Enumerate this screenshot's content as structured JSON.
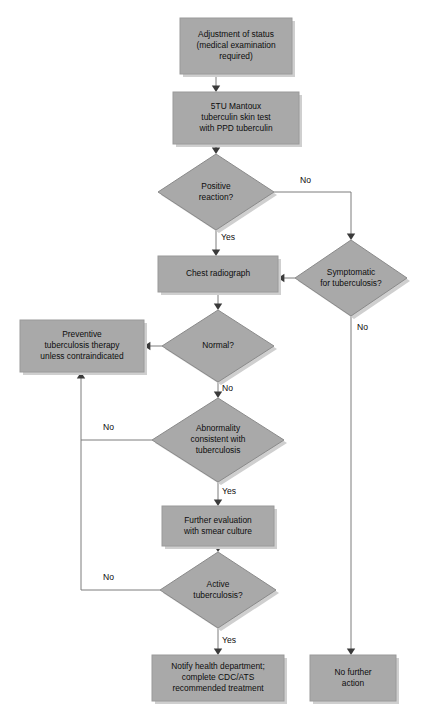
{
  "chart_data": {
    "type": "diagram",
    "subtype": "flowchart",
    "colors": {
      "node_fill": "#a9a9a9",
      "node_stroke": "#8a8a8a",
      "shadow": "#cfcfcf",
      "line": "#7c7c7c",
      "arrow": "#3a3a3a",
      "text": "#0d0d0d",
      "background": "#ffffff"
    },
    "nodes": [
      {
        "id": "adjustment",
        "shape": "box",
        "lines": [
          "Adjustment of status",
          "(medical examination",
          "required)"
        ],
        "x": 180,
        "y": 18,
        "w": 112,
        "h": 56
      },
      {
        "id": "mantoux",
        "shape": "box",
        "lines": [
          "5TU Mantoux",
          "tuberculin skin test",
          "with PPD tuberculin"
        ],
        "x": 173,
        "y": 92,
        "w": 126,
        "h": 52
      },
      {
        "id": "positive_reaction",
        "shape": "diamond",
        "lines": [
          "Positive",
          "reaction?"
        ],
        "cx": 216,
        "cy": 192,
        "rx": 58,
        "ry": 38
      },
      {
        "id": "symptomatic",
        "shape": "diamond",
        "lines": [
          "Symptomatic",
          "for tuberculosis?"
        ],
        "cx": 351,
        "cy": 278,
        "rx": 56,
        "ry": 38
      },
      {
        "id": "chest_radiograph",
        "shape": "box",
        "lines": [
          "Chest radiograph"
        ],
        "x": 158,
        "y": 256,
        "w": 120,
        "h": 36
      },
      {
        "id": "normal",
        "shape": "diamond",
        "lines": [
          "Normal?"
        ],
        "cx": 218,
        "cy": 346,
        "rx": 56,
        "ry": 36
      },
      {
        "id": "preventive",
        "shape": "box",
        "lines": [
          "Preventive",
          "tuberculosis therapy",
          "unless contraindicated"
        ],
        "x": 20,
        "y": 320,
        "w": 124,
        "h": 52
      },
      {
        "id": "abnormality",
        "shape": "diamond",
        "lines": [
          "Abnormality",
          "consistent with",
          "tuberculosis"
        ],
        "cx": 218,
        "cy": 440,
        "rx": 66,
        "ry": 42
      },
      {
        "id": "further_evaluation",
        "shape": "box",
        "lines": [
          "Further evaluation",
          "with smear culture"
        ],
        "x": 162,
        "y": 506,
        "w": 112,
        "h": 40
      },
      {
        "id": "active_tb",
        "shape": "diamond",
        "lines": [
          "Active",
          "tuberculosis?"
        ],
        "cx": 218,
        "cy": 590,
        "rx": 58,
        "ry": 38
      },
      {
        "id": "notify",
        "shape": "box",
        "lines": [
          "Notify health department;",
          "complete CDC/ATS",
          "recommended treatment"
        ],
        "x": 152,
        "y": 655,
        "w": 132,
        "h": 46
      },
      {
        "id": "no_action",
        "shape": "box",
        "lines": [
          "No further",
          "action"
        ],
        "x": 310,
        "y": 655,
        "w": 86,
        "h": 46
      }
    ],
    "edges": [
      {
        "id": "e1",
        "from": "adjustment",
        "to": "mantoux",
        "label": "",
        "path": "M216,74 L216,88",
        "arrow": {
          "x": 216,
          "y": 92,
          "dir": "down"
        }
      },
      {
        "id": "e2",
        "from": "mantoux",
        "to": "positive_reaction",
        "label": "",
        "path": "M216,144 L216,150",
        "arrow": {
          "x": 216,
          "y": 154,
          "dir": "down"
        }
      },
      {
        "id": "e3",
        "from": "positive_reaction",
        "to": "chest_radiograph",
        "label": "Yes",
        "label_x": 221,
        "label_y": 238,
        "path": "M216,230 L216,250",
        "arrow": {
          "x": 216,
          "y": 256,
          "dir": "down"
        }
      },
      {
        "id": "e4",
        "from": "positive_reaction",
        "to": "symptomatic",
        "label": "No",
        "label_x": 300,
        "label_y": 181,
        "path": "M274,192 L351,192 L351,234",
        "arrow": {
          "x": 351,
          "y": 240,
          "dir": "down"
        }
      },
      {
        "id": "e5",
        "from": "symptomatic",
        "to": "chest_radiograph",
        "label": "",
        "path": "M295,278 L284,278",
        "arrow": {
          "x": 278,
          "y": 278,
          "dir": "left"
        }
      },
      {
        "id": "e6",
        "from": "symptomatic",
        "to": "no_action",
        "label": "No",
        "label_x": 357,
        "label_y": 328,
        "path": "M351,316 L351,649",
        "arrow": {
          "x": 351,
          "y": 655,
          "dir": "down"
        }
      },
      {
        "id": "e7",
        "from": "chest_radiograph",
        "to": "normal",
        "label": "",
        "path": "M218,292 L218,305",
        "arrow": {
          "x": 218,
          "y": 310,
          "dir": "down"
        }
      },
      {
        "id": "e8",
        "from": "normal",
        "to": "preventive",
        "label": "",
        "path": "M162,346 L150,346",
        "arrow": {
          "x": 144,
          "y": 346,
          "dir": "left"
        }
      },
      {
        "id": "e9",
        "from": "normal",
        "to": "abnormality",
        "label": "No",
        "label_x": 222,
        "label_y": 389,
        "path": "M218,382 L218,392",
        "arrow": {
          "x": 218,
          "y": 398,
          "dir": "down"
        }
      },
      {
        "id": "e10",
        "from": "abnormality",
        "to": "preventive",
        "label": "No",
        "label_x": 103,
        "label_y": 428,
        "path": "M152,440 L81,440 L81,378",
        "arrow": {
          "x": 81,
          "y": 372,
          "dir": "up"
        }
      },
      {
        "id": "e11",
        "from": "abnormality",
        "to": "further_evaluation",
        "label": "Yes",
        "label_x": 222,
        "label_y": 492,
        "path": "M218,482 L218,500",
        "arrow": {
          "x": 218,
          "y": 506,
          "dir": "down"
        }
      },
      {
        "id": "e12",
        "from": "further_evaluation",
        "to": "active_tb",
        "label": "",
        "path": "M218,546 L218,547",
        "arrow": {
          "x": 218,
          "y": 552,
          "dir": "down"
        }
      },
      {
        "id": "e13",
        "from": "active_tb",
        "to": "preventive",
        "label": "No",
        "label_x": 103,
        "label_y": 578,
        "path": "M160,590 L81,590 L81,440",
        "arrow": null
      },
      {
        "id": "e14",
        "from": "active_tb",
        "to": "notify",
        "label": "Yes",
        "label_x": 222,
        "label_y": 641,
        "path": "M218,628 L218,649",
        "arrow": {
          "x": 218,
          "y": 655,
          "dir": "down"
        }
      }
    ]
  }
}
